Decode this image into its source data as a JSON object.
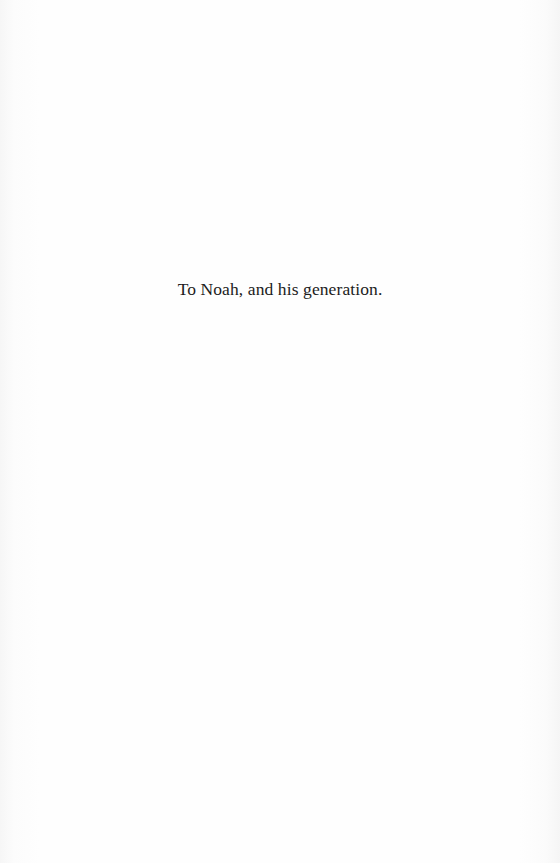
{
  "page": {
    "dedication": "To Noah, and his generation."
  }
}
